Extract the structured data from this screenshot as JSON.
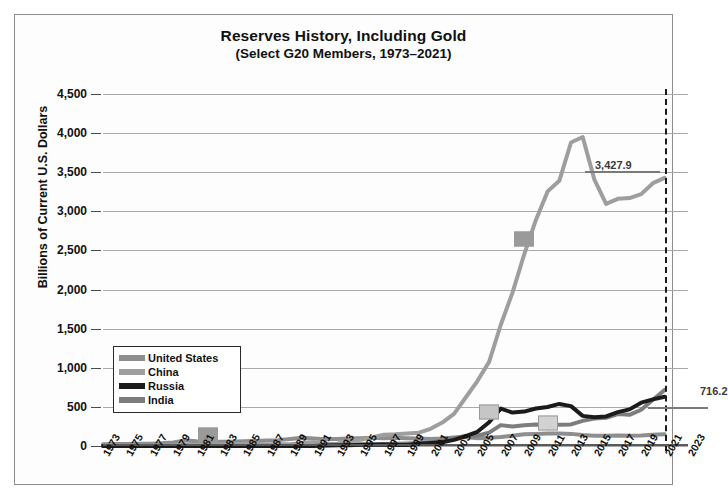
{
  "chart_data": {
    "type": "line",
    "title": "Reserves History, Including Gold",
    "subtitle": "(Select G20 Members, 1973–2021)",
    "ylabel": "Billions of Current U.S. Dollars",
    "xlabel": "",
    "ylim": [
      0,
      4500
    ],
    "ytick_labels": [
      "4,500",
      "4,000",
      "3,500",
      "3,000",
      "2,500",
      "2,000",
      "1,500",
      "1,000",
      "500",
      "0"
    ],
    "ytick_values": [
      4500,
      4000,
      3500,
      3000,
      2500,
      2000,
      1500,
      1000,
      500,
      0
    ],
    "xlim": [
      1973,
      2023
    ],
    "xtick_labels": [
      "1973",
      "1975",
      "1977",
      "1979",
      "1981",
      "1983",
      "1985",
      "1987",
      "1989",
      "1991",
      "1993",
      "1995",
      "1997",
      "1999",
      "2001",
      "2003",
      "2005",
      "2007",
      "2009",
      "2011",
      "2013",
      "2015",
      "2017",
      "2019",
      "2021",
      "2023"
    ],
    "grid": "horizontal",
    "legend_position": "inside-left",
    "x": [
      1973,
      1974,
      1975,
      1976,
      1977,
      1978,
      1979,
      1980,
      1981,
      1982,
      1983,
      1984,
      1985,
      1986,
      1987,
      1988,
      1989,
      1990,
      1991,
      1992,
      1993,
      1994,
      1995,
      1996,
      1997,
      1998,
      1999,
      2000,
      2001,
      2002,
      2003,
      2004,
      2005,
      2006,
      2007,
      2008,
      2009,
      2010,
      2011,
      2012,
      2013,
      2014,
      2015,
      2016,
      2017,
      2018,
      2019,
      2020,
      2021
    ],
    "series": [
      {
        "name": "United States",
        "color": "#8e8e8e",
        "values": [
          22,
          24,
          26,
          28,
          30,
          35,
          45,
          70,
          60,
          55,
          55,
          55,
          60,
          65,
          70,
          75,
          90,
          105,
          95,
          85,
          90,
          95,
          100,
          105,
          100,
          105,
          100,
          95,
          90,
          95,
          110,
          115,
          100,
          105,
          115,
          130,
          150,
          155,
          160,
          160,
          155,
          140,
          130,
          130,
          135,
          130,
          135,
          145,
          150
        ]
      },
      {
        "name": "China",
        "color": "#9e9e9e",
        "values": [
          5,
          5,
          5,
          6,
          6,
          7,
          8,
          12,
          10,
          18,
          22,
          25,
          28,
          24,
          20,
          22,
          23,
          40,
          48,
          25,
          28,
          60,
          80,
          110,
          145,
          150,
          160,
          170,
          220,
          300,
          410,
          620,
          830,
          1075,
          1550,
          1960,
          2450,
          2890,
          3255,
          3390,
          3880,
          3950,
          3405,
          3095,
          3160,
          3170,
          3220,
          3360,
          3427.9
        ]
      },
      {
        "name": "Russia",
        "color": "#1b1b1b",
        "values": [
          0,
          0,
          0,
          0,
          0,
          0,
          0,
          0,
          0,
          0,
          0,
          0,
          0,
          0,
          0,
          0,
          0,
          0,
          0,
          5,
          10,
          8,
          17,
          15,
          18,
          12,
          13,
          28,
          37,
          48,
          78,
          125,
          182,
          304,
          478,
          427,
          440,
          479,
          499,
          538,
          510,
          385,
          368,
          378,
          433,
          468,
          554,
          596,
          630
        ]
      },
      {
        "name": "India",
        "color": "#7d7d7d",
        "values": [
          1,
          1,
          2,
          3,
          4,
          6,
          7,
          7,
          6,
          5,
          5,
          6,
          7,
          7,
          7,
          5,
          5,
          3,
          6,
          9,
          13,
          20,
          20,
          22,
          26,
          28,
          33,
          38,
          46,
          68,
          99,
          127,
          132,
          171,
          267,
          248,
          266,
          275,
          271,
          271,
          276,
          322,
          350,
          360,
          409,
          399,
          463,
          590,
          716.2
        ]
      }
    ],
    "annotations": [
      {
        "label": "3,427.9",
        "series": "China",
        "year": 2021,
        "value": 3427.9
      },
      {
        "label": "716.2",
        "series": "India",
        "year": 2021,
        "value": 716.2
      }
    ],
    "markers": [
      {
        "series": "United States",
        "year": 1982,
        "value": 140,
        "color": "#9a9a9a"
      },
      {
        "series": "China",
        "year": 2009,
        "value": 2650,
        "color": "#9a9a9a"
      },
      {
        "series": "Russia",
        "year": 2006,
        "value": 440,
        "color": "#c6c6c6"
      },
      {
        "series": "India",
        "year": 2011,
        "value": 300,
        "color": "#d2d2d2"
      }
    ],
    "reference_line": {
      "year": 2021,
      "style": "dashed",
      "color": "#1a1a1a"
    }
  },
  "legend": {
    "items": [
      {
        "label": "United States",
        "color": "#8e8e8e"
      },
      {
        "label": "China",
        "color": "#9e9e9e"
      },
      {
        "label": "Russia",
        "color": "#1b1b1b"
      },
      {
        "label": "India",
        "color": "#7d7d7d"
      }
    ]
  }
}
